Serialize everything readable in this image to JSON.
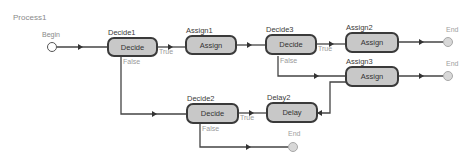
{
  "process": {
    "title": "Process1"
  },
  "terminals": {
    "begin": {
      "label": "Begin"
    },
    "end1": {
      "label": "End"
    },
    "end2": {
      "label": "End"
    },
    "end3": {
      "label": "End"
    }
  },
  "nodes": {
    "decide1": {
      "name": "Decide1",
      "type": "Decide"
    },
    "assign1": {
      "name": "Assign1",
      "type": "Assign"
    },
    "decide3": {
      "name": "Decide3",
      "type": "Decide"
    },
    "assign2": {
      "name": "Assign2",
      "type": "Assign"
    },
    "assign3": {
      "name": "Assign3",
      "type": "Assign"
    },
    "decide2": {
      "name": "Decide2",
      "type": "Decide"
    },
    "delay2": {
      "name": "Delay2",
      "type": "Delay"
    }
  },
  "edges": {
    "decide1_true": "True",
    "decide1_false": "False",
    "decide3_true": "True",
    "decide3_false": "False",
    "decide2_true": "True",
    "decide2_false": "False"
  },
  "colors": {
    "node_fill": "#c8c8c8",
    "node_border": "#3a3a3a",
    "end_fill": "#d8d8d8"
  }
}
